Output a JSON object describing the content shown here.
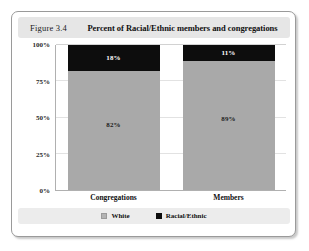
{
  "figure": {
    "number": "Figure 3.4",
    "title": "Percent of Racial/Ethnic members and congregations"
  },
  "legend": {
    "items": [
      {
        "label": "White",
        "color": "#a9a9a9"
      },
      {
        "label": "Racial/Ethnic",
        "color": "#0d0d0d"
      }
    ]
  },
  "chart_data": {
    "type": "bar",
    "subtype": "stacked-100-percent",
    "title": "Percent of Racial/Ethnic members and congregations",
    "xlabel": "",
    "ylabel": "",
    "categories": [
      "Congregations",
      "Members"
    ],
    "series": [
      {
        "name": "White",
        "color": "#a9a9a9",
        "values": [
          82,
          89
        ],
        "value_labels": [
          "82%",
          "89%"
        ]
      },
      {
        "name": "Racial/Ethnic",
        "color": "#0d0d0d",
        "values": [
          18,
          11
        ],
        "value_labels": [
          "18%",
          "11%"
        ]
      }
    ],
    "ylim": [
      0,
      100
    ],
    "yticks": [
      0,
      25,
      50,
      75,
      100
    ],
    "ytick_labels": [
      "0%",
      "25%",
      "50%",
      "75%",
      "100%"
    ],
    "grid": true,
    "legend_position": "bottom"
  }
}
